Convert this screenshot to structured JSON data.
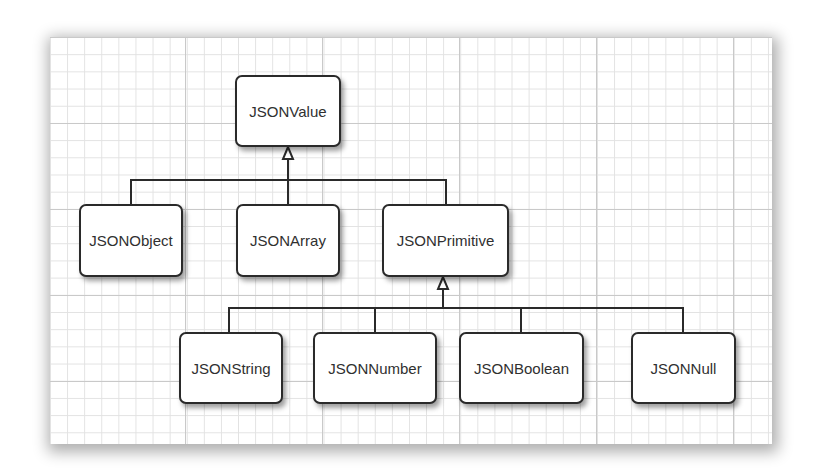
{
  "diagram": {
    "type": "class-hierarchy",
    "root": {
      "label": "JSONValue"
    },
    "level1": [
      {
        "label": "JSONObject"
      },
      {
        "label": "JSONArray"
      },
      {
        "label": "JSONPrimitive"
      }
    ],
    "level2": [
      {
        "label": "JSONString"
      },
      {
        "label": "JSONNumber"
      },
      {
        "label": "JSONBoolean"
      },
      {
        "label": "JSONNull"
      }
    ],
    "edges": [
      {
        "from": "JSONObject",
        "to": "JSONValue",
        "kind": "inheritance"
      },
      {
        "from": "JSONArray",
        "to": "JSONValue",
        "kind": "inheritance"
      },
      {
        "from": "JSONPrimitive",
        "to": "JSONValue",
        "kind": "inheritance"
      },
      {
        "from": "JSONString",
        "to": "JSONPrimitive",
        "kind": "inheritance"
      },
      {
        "from": "JSONNumber",
        "to": "JSONPrimitive",
        "kind": "inheritance"
      },
      {
        "from": "JSONBoolean",
        "to": "JSONPrimitive",
        "kind": "inheritance"
      },
      {
        "from": "JSONNull",
        "to": "JSONPrimitive",
        "kind": "inheritance"
      }
    ],
    "colors": {
      "line": "#2a2a2a",
      "box_fill": "#ffffff",
      "text": "#303030",
      "grid_minor": "#e2e2e2",
      "grid_major": "#c9c9c9"
    }
  }
}
